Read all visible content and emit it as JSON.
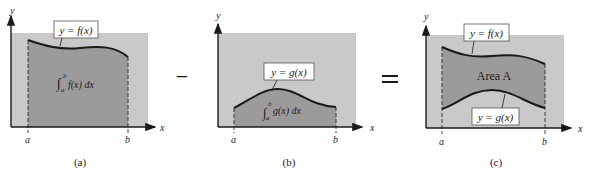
{
  "colors": {
    "background": "#ffffff",
    "light_region": "#c9c9c9",
    "dark_region": "#9b9b9b",
    "curve": "#1a1a1a",
    "label_box": "#ffffff"
  },
  "operators": {
    "minus": "−",
    "equals": "="
  },
  "panels": [
    {
      "id": "a",
      "caption": "(a)",
      "axis": {
        "x_label": "x",
        "y_label": "y"
      },
      "bounds": {
        "a": "a",
        "b": "b"
      },
      "curve_label": "y = f(x)",
      "region_label": {
        "integral_upper": "b",
        "integral_lower": "a",
        "integrand": "f(x) dx"
      }
    },
    {
      "id": "b",
      "caption": "(b)",
      "axis": {
        "x_label": "x",
        "y_label": "y"
      },
      "bounds": {
        "a": "a",
        "b": "b"
      },
      "curve_label": "y = g(x)",
      "region_label": {
        "integral_upper": "b",
        "integral_lower": "a",
        "integrand": "g(x) dx"
      }
    },
    {
      "id": "c",
      "caption": "(c)",
      "axis": {
        "x_label": "x",
        "y_label": "y"
      },
      "bounds": {
        "a": "a",
        "b": "b"
      },
      "upper_curve_label": "y = f(x)",
      "lower_curve_label": "y = g(x)",
      "region_label": "Area A"
    }
  ]
}
